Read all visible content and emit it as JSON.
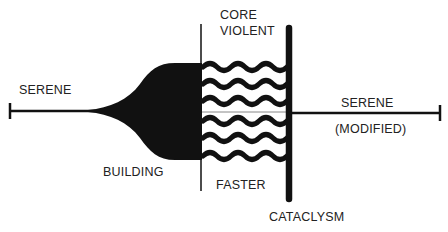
{
  "diagram": {
    "labels": {
      "serene_left": "SERENE",
      "building": "BUILDING",
      "core": "CORE",
      "violent": "VIOLENT",
      "faster": "FASTER",
      "serene_right": "SERENE",
      "modified": "(MODIFIED)",
      "cataclysm": "CATACLYSM"
    },
    "colors": {
      "ink": "#111111",
      "text": "#222222",
      "background": "#ffffff",
      "center_line": "#888888"
    },
    "wave_count": 6
  }
}
